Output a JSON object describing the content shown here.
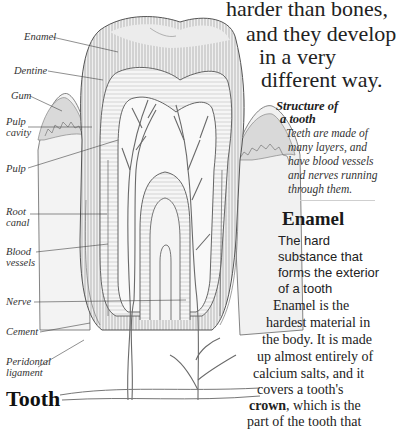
{
  "intro": {
    "lines": [
      "harder than bones,",
      "and they develop",
      "in a very",
      "different way."
    ]
  },
  "diagram": {
    "labels": [
      {
        "id": "enamel",
        "text": "Enamel"
      },
      {
        "id": "dentine",
        "text": "Dentine"
      },
      {
        "id": "gum",
        "text": "Gum"
      },
      {
        "id": "pulp-cavity",
        "text": "Pulp\ncavity",
        "lines": [
          "Pulp",
          "cavity"
        ]
      },
      {
        "id": "pulp",
        "text": "Pulp"
      },
      {
        "id": "root-canal",
        "text": "Root canal",
        "lines": [
          "Root",
          "canal"
        ]
      },
      {
        "id": "blood-vessels",
        "text": "Blood vessels",
        "lines": [
          "Blood",
          "vessels"
        ]
      },
      {
        "id": "nerve",
        "text": "Nerve"
      },
      {
        "id": "cement",
        "text": "Cement"
      },
      {
        "id": "periodontal-ligament",
        "text": "Peridontal ligament",
        "lines": [
          "Peridontal",
          "ligament"
        ]
      }
    ],
    "colors": {
      "enamel_fill": "#e4e4e4",
      "gum_fill": "#dcdcdc",
      "line": "#555555",
      "vessel": "#6a6a6a"
    }
  },
  "caption": {
    "title_lines": [
      "Structure of",
      "a tooth"
    ],
    "body": "Teeth are made of many layers, and have blood vessels and nerves running through them.",
    "body_lines": [
      "Teeth are made of",
      "many layers, and",
      "have blood vessels",
      "and nerves running",
      "through them."
    ]
  },
  "entry": {
    "heading": "Enamel",
    "definition_lines": [
      "The hard",
      "substance that",
      "forms the exterior",
      "of a tooth"
    ],
    "body_lines": [
      "Enamel is the",
      "hardest material in",
      "the body. It is made",
      "up almost entirely of",
      "calcium salts, and it",
      "covers a tooth's"
    ],
    "crown_word": "crown",
    "crown_rest": ", which is the",
    "last_line": "part of the tooth that"
  },
  "bottom_heading": "Tooth"
}
